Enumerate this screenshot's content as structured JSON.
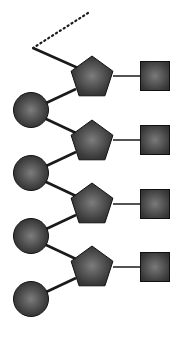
{
  "figure": {
    "type": "node-link-diagram",
    "width": 187,
    "height": 339,
    "background_color": "#ffffff"
  },
  "style": {
    "fill_center_color": "#767676",
    "fill_mid_color": "#4a4a4a",
    "fill_edge_color": "#2f2f2f",
    "outline_color": "#111111",
    "link_color": "#1a1a1a",
    "link_width_backbone": 2.6,
    "link_width_branch": 1.5,
    "dotted_dash_pattern": "1.2 3.4",
    "dotted_width": 2.2
  },
  "geometry": {
    "circle_radius": 17.5,
    "pentagon_radius": 22,
    "square_half": 14.5
  },
  "nodes": [
    {
      "id": "pent-1",
      "shape": "pentagon",
      "label": "pentagon-node-1",
      "cx": 92,
      "cy": 78
    },
    {
      "id": "pent-2",
      "shape": "pentagon",
      "label": "pentagon-node-2",
      "cx": 92,
      "cy": 142
    },
    {
      "id": "pent-3",
      "shape": "pentagon",
      "label": "pentagon-node-3",
      "cx": 92,
      "cy": 205
    },
    {
      "id": "pent-4",
      "shape": "pentagon",
      "label": "pentagon-node-4",
      "cx": 92,
      "cy": 268
    },
    {
      "id": "circ-1",
      "shape": "circle",
      "label": "circle-node-1",
      "cx": 31,
      "cy": 110
    },
    {
      "id": "circ-2",
      "shape": "circle",
      "label": "circle-node-2",
      "cx": 31,
      "cy": 173
    },
    {
      "id": "circ-3",
      "shape": "circle",
      "label": "circle-node-3",
      "cx": 31,
      "cy": 236
    },
    {
      "id": "circ-4",
      "shape": "circle",
      "label": "circle-node-4",
      "cx": 31,
      "cy": 299
    },
    {
      "id": "sq-1",
      "shape": "square",
      "label": "square-node-1",
      "cx": 155,
      "cy": 76
    },
    {
      "id": "sq-2",
      "shape": "square",
      "label": "square-node-2",
      "cx": 155,
      "cy": 140
    },
    {
      "id": "sq-3",
      "shape": "square",
      "label": "square-node-3",
      "cx": 155,
      "cy": 204
    },
    {
      "id": "sq-4",
      "shape": "square",
      "label": "square-node-4",
      "cx": 155,
      "cy": 267
    }
  ],
  "links": [
    {
      "id": "link-dotted-tail",
      "style": "dotted",
      "from": [
        88,
        13
      ],
      "to": [
        33,
        48
      ],
      "label": "dotted-branch-link"
    },
    {
      "id": "link-root",
      "style": "solid-backbone",
      "from": [
        33,
        48
      ],
      "to": [
        78,
        68
      ],
      "label": "root-link"
    },
    {
      "id": "link-p1-c1",
      "style": "solid-backbone",
      "from": [
        76,
        89
      ],
      "to": [
        44,
        104
      ],
      "label": "pentagon-1-to-circle-1-link"
    },
    {
      "id": "link-c1-p2",
      "style": "solid-backbone",
      "from": [
        44,
        118
      ],
      "to": [
        76,
        133
      ],
      "label": "circle-1-to-pentagon-2-link"
    },
    {
      "id": "link-p2-c2",
      "style": "solid-backbone",
      "from": [
        76,
        152
      ],
      "to": [
        44,
        167
      ],
      "label": "pentagon-2-to-circle-2-link"
    },
    {
      "id": "link-c2-p3",
      "style": "solid-backbone",
      "from": [
        44,
        181
      ],
      "to": [
        76,
        196
      ],
      "label": "circle-2-to-pentagon-3-link"
    },
    {
      "id": "link-p3-c3",
      "style": "solid-backbone",
      "from": [
        76,
        215
      ],
      "to": [
        44,
        230
      ],
      "label": "pentagon-3-to-circle-3-link"
    },
    {
      "id": "link-c3-p4",
      "style": "solid-backbone",
      "from": [
        44,
        244
      ],
      "to": [
        76,
        259
      ],
      "label": "circle-3-to-pentagon-4-link"
    },
    {
      "id": "link-p4-c4",
      "style": "solid-backbone",
      "from": [
        76,
        278
      ],
      "to": [
        44,
        293
      ],
      "label": "pentagon-4-to-circle-4-link"
    },
    {
      "id": "link-p1-s1",
      "style": "solid-branch",
      "from": [
        113,
        76
      ],
      "to": [
        141,
        76
      ],
      "label": "pentagon-1-to-square-1-link"
    },
    {
      "id": "link-p2-s2",
      "style": "solid-branch",
      "from": [
        113,
        140
      ],
      "to": [
        141,
        140
      ],
      "label": "pentagon-2-to-square-2-link"
    },
    {
      "id": "link-p3-s3",
      "style": "solid-branch",
      "from": [
        113,
        204
      ],
      "to": [
        141,
        204
      ],
      "label": "pentagon-3-to-square-3-link"
    },
    {
      "id": "link-p4-s4",
      "style": "solid-branch",
      "from": [
        113,
        267
      ],
      "to": [
        141,
        267
      ],
      "label": "pentagon-4-to-square-4-link"
    }
  ]
}
